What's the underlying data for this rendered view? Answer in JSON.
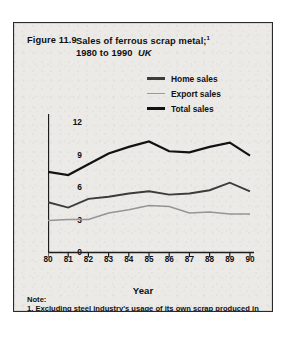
{
  "figure": {
    "number_label": "Figure 11.9",
    "title_line1": "Sales of ferrous scrap metal;",
    "title_superscript": "1",
    "title_line2": "1980 to 1990",
    "title_region": "UK",
    "unit_label": "Million\ntonnes",
    "axis_title_x": "Year",
    "note_heading": "Note:",
    "note_text": "1. Excluding steel industry's usage of its own scrap produced in making iron and steel.",
    "source": "Source: British Scrap Federation"
  },
  "legend": {
    "position": "top-right",
    "items": [
      {
        "label": "Home sales",
        "icon": "line-swatch-icon",
        "color": "#3b3b3b"
      },
      {
        "label": "Export sales",
        "icon": "line-swatch-icon",
        "color": "#9a9a9a"
      },
      {
        "label": "Total sales",
        "icon": "line-swatch-icon",
        "color": "#111111"
      }
    ]
  },
  "chart_data": {
    "type": "line",
    "xlabel": "Year",
    "ylabel": "Million tonnes",
    "x": [
      1980,
      1981,
      1982,
      1983,
      1984,
      1985,
      1986,
      1987,
      1988,
      1989,
      1990
    ],
    "categories": [
      "80",
      "81",
      "82",
      "83",
      "84",
      "85",
      "86",
      "87",
      "88",
      "89",
      "90"
    ],
    "xlim": [
      1980,
      1990
    ],
    "ylim": [
      0,
      12
    ],
    "yticks": [
      0,
      3,
      6,
      9,
      12
    ],
    "grid": false,
    "series": [
      {
        "name": "Total sales",
        "values": [
          7.4,
          7.1,
          8.1,
          9.1,
          9.7,
          10.2,
          9.3,
          9.2,
          9.7,
          10.1,
          8.9
        ]
      },
      {
        "name": "Home sales",
        "values": [
          4.6,
          4.1,
          4.9,
          5.1,
          5.4,
          5.6,
          5.3,
          5.4,
          5.7,
          6.4,
          5.6
        ]
      },
      {
        "name": "Export sales",
        "values": [
          2.9,
          3.0,
          3.0,
          3.6,
          3.9,
          4.3,
          4.2,
          3.6,
          3.7,
          3.5,
          3.5
        ]
      }
    ]
  }
}
